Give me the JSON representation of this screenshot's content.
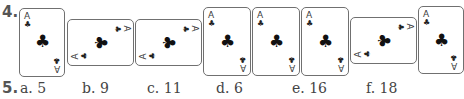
{
  "question4": {
    "number": "4.",
    "cards": [
      {
        "rank": "A",
        "suit": "club",
        "suit_glyph": "♣",
        "orientation": "upright"
      },
      {
        "rank": "A",
        "suit": "club",
        "suit_glyph": "♣",
        "orientation": "rotated-right"
      },
      {
        "rank": "A",
        "suit": "club",
        "suit_glyph": "♣",
        "orientation": "rotated-right"
      },
      {
        "rank": "A",
        "suit": "club",
        "suit_glyph": "♣",
        "orientation": "upright"
      },
      {
        "rank": "A",
        "suit": "club",
        "suit_glyph": "♣",
        "orientation": "upright"
      },
      {
        "rank": "A",
        "suit": "club",
        "suit_glyph": "♣",
        "orientation": "upright"
      },
      {
        "rank": "A",
        "suit": "club",
        "suit_glyph": "♣",
        "orientation": "rotated-right"
      },
      {
        "rank": "A",
        "suit": "club",
        "suit_glyph": "♣",
        "orientation": "upright"
      }
    ]
  },
  "question5": {
    "number": "5.",
    "options": [
      {
        "label": "a.",
        "value": "5"
      },
      {
        "label": "b.",
        "value": "9"
      },
      {
        "label": "c.",
        "value": "11"
      },
      {
        "label": "d.",
        "value": "6"
      },
      {
        "label": "e.",
        "value": "16"
      },
      {
        "label": "f.",
        "value": "18"
      }
    ]
  }
}
